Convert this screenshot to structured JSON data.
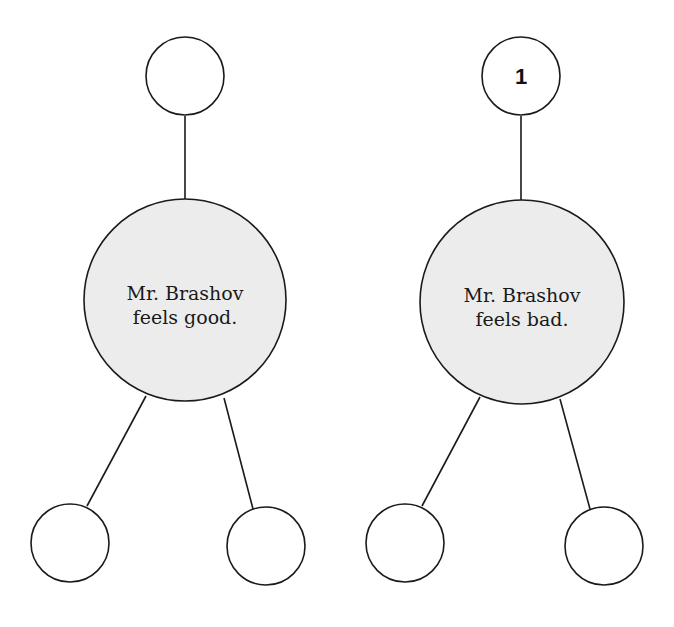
{
  "diagrams": [
    {
      "name": "good",
      "center_node": {
        "line1": "Mr. Brashov",
        "line2": "feels good."
      },
      "top_node": {
        "label": ""
      },
      "bottom_left_node": {
        "label": ""
      },
      "bottom_right_node": {
        "label": ""
      }
    },
    {
      "name": "bad",
      "center_node": {
        "line1": "Mr. Brashov",
        "line2": "feels bad."
      },
      "top_node": {
        "label": "1"
      },
      "bottom_left_node": {
        "label": ""
      },
      "bottom_right_node": {
        "label": ""
      }
    }
  ],
  "colors": {
    "main_fill": "#ececec",
    "stroke": "#1a1a1a",
    "background": "#ffffff"
  }
}
